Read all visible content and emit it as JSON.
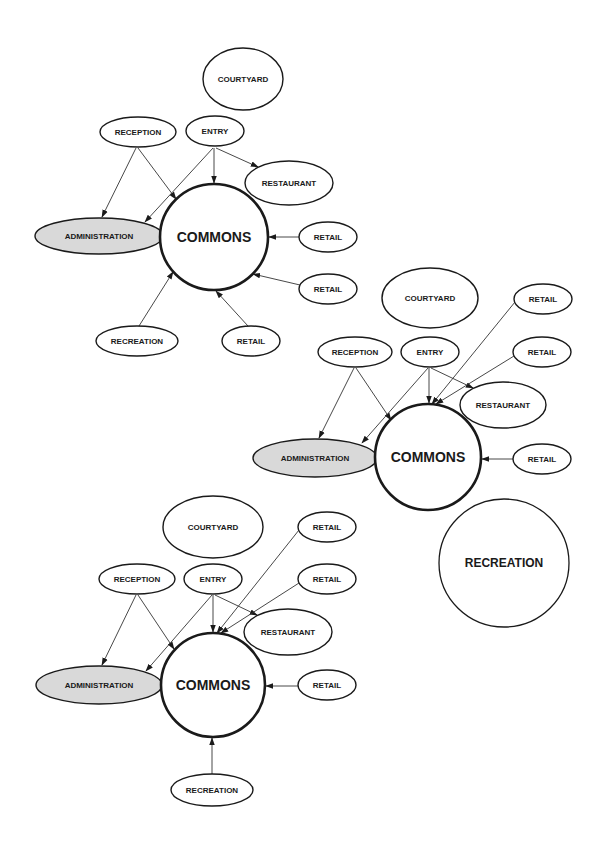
{
  "diagrams": [
    {
      "id": "diagram-1",
      "nodes": [
        {
          "key": "courtyard",
          "label": "COURTYARD",
          "cx": 243,
          "cy": 79,
          "rx": 40,
          "ry": 31,
          "style": ""
        },
        {
          "key": "reception",
          "label": "RECEPTION",
          "cx": 138,
          "cy": 132,
          "rx": 38,
          "ry": 15,
          "style": ""
        },
        {
          "key": "entry",
          "label": "ENTRY",
          "cx": 215,
          "cy": 131,
          "rx": 29,
          "ry": 15,
          "style": ""
        },
        {
          "key": "restaurant",
          "label": "RESTAURANT",
          "cx": 289,
          "cy": 183,
          "rx": 44,
          "ry": 22,
          "style": ""
        },
        {
          "key": "administration",
          "label": "ADMINISTRATION",
          "cx": 99,
          "cy": 236,
          "rx": 64,
          "ry": 18,
          "style": "shaded"
        },
        {
          "key": "commons",
          "label": "COMMONS",
          "cx": 214,
          "cy": 237,
          "rx": 54,
          "ry": 53,
          "style": "hub"
        },
        {
          "key": "retail-1",
          "label": "RETAIL",
          "cx": 328,
          "cy": 237,
          "rx": 29,
          "ry": 15,
          "style": ""
        },
        {
          "key": "retail-2",
          "label": "RETAIL",
          "cx": 328,
          "cy": 289,
          "rx": 29,
          "ry": 15,
          "style": ""
        },
        {
          "key": "recreation",
          "label": "RECREATION",
          "cx": 137,
          "cy": 341,
          "rx": 41,
          "ry": 15,
          "style": ""
        },
        {
          "key": "retail-3",
          "label": "RETAIL",
          "cx": 251,
          "cy": 341,
          "rx": 29,
          "ry": 15,
          "style": ""
        }
      ],
      "edges": [
        {
          "from": "reception",
          "to": "administration",
          "x1": 136,
          "y1": 148,
          "x2": 102,
          "y2": 217
        },
        {
          "from": "reception",
          "to": "commons",
          "x1": 138,
          "y1": 148,
          "x2": 176,
          "y2": 199
        },
        {
          "from": "entry",
          "to": "administration",
          "x1": 213,
          "y1": 148,
          "x2": 145,
          "y2": 222
        },
        {
          "from": "entry",
          "to": "commons",
          "x1": 214,
          "y1": 148,
          "x2": 214,
          "y2": 183
        },
        {
          "from": "entry",
          "to": "restaurant",
          "x1": 216,
          "y1": 148,
          "x2": 258,
          "y2": 167
        },
        {
          "from": "retail-1",
          "to": "commons",
          "x1": 299,
          "y1": 237,
          "x2": 269,
          "y2": 237
        },
        {
          "from": "retail-2",
          "to": "commons",
          "x1": 300,
          "y1": 285,
          "x2": 253,
          "y2": 274
        },
        {
          "from": "retail-3",
          "to": "commons",
          "x1": 248,
          "y1": 326,
          "x2": 216,
          "y2": 291
        },
        {
          "from": "recreation",
          "to": "commons",
          "x1": 139,
          "y1": 326,
          "x2": 173,
          "y2": 272
        }
      ]
    },
    {
      "id": "diagram-2",
      "nodes": [
        {
          "key": "courtyard",
          "label": "COURTYARD",
          "cx": 430,
          "cy": 298,
          "rx": 48,
          "ry": 30,
          "style": ""
        },
        {
          "key": "retail-a",
          "label": "RETAIL",
          "cx": 543,
          "cy": 299,
          "rx": 29,
          "ry": 15,
          "style": ""
        },
        {
          "key": "reception",
          "label": "RECEPTION",
          "cx": 355,
          "cy": 352,
          "rx": 37,
          "ry": 15,
          "style": ""
        },
        {
          "key": "entry",
          "label": "ENTRY",
          "cx": 430,
          "cy": 352,
          "rx": 29,
          "ry": 15,
          "style": ""
        },
        {
          "key": "retail-b",
          "label": "RETAIL",
          "cx": 542,
          "cy": 352,
          "rx": 29,
          "ry": 15,
          "style": ""
        },
        {
          "key": "restaurant",
          "label": "RESTAURANT",
          "cx": 503,
          "cy": 405,
          "rx": 43,
          "ry": 23,
          "style": ""
        },
        {
          "key": "administration",
          "label": "ADMINISTRATION",
          "cx": 315,
          "cy": 458,
          "rx": 62,
          "ry": 19,
          "style": "shaded"
        },
        {
          "key": "commons",
          "label": "COMMONS",
          "cx": 428,
          "cy": 457,
          "rx": 53,
          "ry": 53,
          "style": "hub"
        },
        {
          "key": "retail-c",
          "label": "RETAIL",
          "cx": 542,
          "cy": 459,
          "rx": 29,
          "ry": 15,
          "style": ""
        },
        {
          "key": "recreation",
          "label": "RECREATION",
          "cx": 504,
          "cy": 563,
          "rx": 65,
          "ry": 64,
          "style": "big"
        }
      ],
      "edges": [
        {
          "from": "reception",
          "to": "administration",
          "x1": 354,
          "y1": 368,
          "x2": 319,
          "y2": 438
        },
        {
          "from": "reception",
          "to": "commons",
          "x1": 356,
          "y1": 368,
          "x2": 391,
          "y2": 420
        },
        {
          "from": "entry",
          "to": "administration",
          "x1": 428,
          "y1": 368,
          "x2": 362,
          "y2": 443
        },
        {
          "from": "entry",
          "to": "commons",
          "x1": 429,
          "y1": 368,
          "x2": 429,
          "y2": 403
        },
        {
          "from": "entry",
          "to": "restaurant",
          "x1": 431,
          "y1": 368,
          "x2": 473,
          "y2": 388
        },
        {
          "from": "retail-a",
          "to": "commons",
          "x1": 515,
          "y1": 302,
          "x2": 432,
          "y2": 404
        },
        {
          "from": "retail-b",
          "to": "commons",
          "x1": 514,
          "y1": 356,
          "x2": 436,
          "y2": 404
        },
        {
          "from": "retail-c",
          "to": "commons",
          "x1": 513,
          "y1": 459,
          "x2": 482,
          "y2": 459
        }
      ]
    },
    {
      "id": "diagram-3",
      "nodes": [
        {
          "key": "courtyard",
          "label": "COURTYARD",
          "cx": 213,
          "cy": 527,
          "rx": 50,
          "ry": 31,
          "style": ""
        },
        {
          "key": "retail-a",
          "label": "RETAIL",
          "cx": 327,
          "cy": 527,
          "rx": 29,
          "ry": 15,
          "style": ""
        },
        {
          "key": "reception",
          "label": "RECEPTION",
          "cx": 137,
          "cy": 579,
          "rx": 38,
          "ry": 15,
          "style": ""
        },
        {
          "key": "entry",
          "label": "ENTRY",
          "cx": 213,
          "cy": 579,
          "rx": 29,
          "ry": 15,
          "style": ""
        },
        {
          "key": "retail-b",
          "label": "RETAIL",
          "cx": 327,
          "cy": 579,
          "rx": 29,
          "ry": 15,
          "style": ""
        },
        {
          "key": "restaurant",
          "label": "RESTAURANT",
          "cx": 288,
          "cy": 632,
          "rx": 44,
          "ry": 23,
          "style": ""
        },
        {
          "key": "administration",
          "label": "ADMINISTRATION",
          "cx": 99,
          "cy": 685,
          "rx": 63,
          "ry": 19,
          "style": "shaded"
        },
        {
          "key": "commons",
          "label": "COMMONS",
          "cx": 213,
          "cy": 685,
          "rx": 52,
          "ry": 52,
          "style": "hub"
        },
        {
          "key": "retail-c",
          "label": "RETAIL",
          "cx": 327,
          "cy": 685,
          "rx": 29,
          "ry": 15,
          "style": ""
        },
        {
          "key": "recreation",
          "label": "RECREATION",
          "cx": 212,
          "cy": 790,
          "rx": 41,
          "ry": 16,
          "style": ""
        }
      ],
      "edges": [
        {
          "from": "reception",
          "to": "administration",
          "x1": 136,
          "y1": 595,
          "x2": 102,
          "y2": 665
        },
        {
          "from": "reception",
          "to": "commons",
          "x1": 138,
          "y1": 595,
          "x2": 174,
          "y2": 649
        },
        {
          "from": "entry",
          "to": "administration",
          "x1": 212,
          "y1": 595,
          "x2": 146,
          "y2": 671
        },
        {
          "from": "entry",
          "to": "commons",
          "x1": 213,
          "y1": 595,
          "x2": 213,
          "y2": 632
        },
        {
          "from": "entry",
          "to": "restaurant",
          "x1": 215,
          "y1": 595,
          "x2": 257,
          "y2": 615
        },
        {
          "from": "retail-a",
          "to": "commons",
          "x1": 299,
          "y1": 530,
          "x2": 217,
          "y2": 633
        },
        {
          "from": "retail-b",
          "to": "commons",
          "x1": 299,
          "y1": 583,
          "x2": 221,
          "y2": 633
        },
        {
          "from": "retail-c",
          "to": "commons",
          "x1": 298,
          "y1": 686,
          "x2": 266,
          "y2": 686
        },
        {
          "from": "recreation",
          "to": "commons",
          "x1": 212,
          "y1": 774,
          "x2": 212,
          "y2": 738
        }
      ]
    }
  ]
}
